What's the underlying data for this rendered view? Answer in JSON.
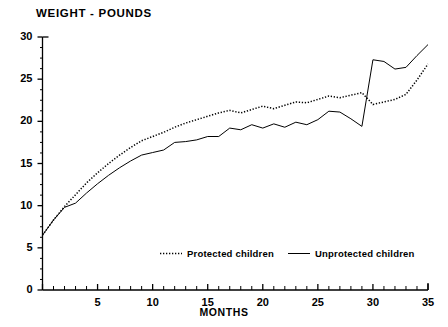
{
  "chart_data": {
    "type": "line",
    "title": "WEIGHT - POUNDS",
    "xlabel": "MONTHS",
    "ylabel": "WEIGHT - POUNDS",
    "xlim": [
      0,
      35
    ],
    "ylim": [
      0,
      30
    ],
    "grid": false,
    "legend_position": "inside-bottom-center",
    "y_ticks": [
      0,
      5,
      10,
      15,
      20,
      25,
      30
    ],
    "y_minor_tick_step": 1.25,
    "x_ticks": [
      0,
      5,
      10,
      15,
      20,
      25,
      30,
      35
    ],
    "x_tick_labels": [
      "",
      "5",
      "10",
      "15",
      "20",
      "25",
      "30",
      "35"
    ],
    "x_minor_tick_step": 1,
    "x": [
      0,
      1,
      2,
      3,
      4,
      5,
      6,
      7,
      8,
      9,
      10,
      11,
      12,
      13,
      14,
      15,
      16,
      17,
      18,
      19,
      20,
      21,
      22,
      23,
      24,
      25,
      26,
      27,
      28,
      29,
      30,
      31,
      32,
      33,
      34,
      35
    ],
    "series": [
      {
        "name": "Protected children",
        "style": "dotted",
        "color": "#000000",
        "values": [
          6.5,
          8.3,
          9.9,
          11.3,
          12.7,
          13.9,
          15.0,
          16.0,
          16.9,
          17.7,
          18.2,
          18.7,
          19.3,
          19.8,
          20.2,
          20.6,
          21.0,
          21.3,
          21.0,
          21.4,
          21.8,
          21.5,
          21.9,
          22.3,
          22.2,
          22.6,
          23.0,
          22.8,
          23.1,
          23.4,
          22.0,
          22.3,
          22.6,
          23.2,
          24.9,
          26.8
        ]
      },
      {
        "name": "Unprotected children",
        "style": "solid",
        "color": "#000000",
        "values": [
          6.5,
          8.3,
          9.8,
          10.3,
          11.5,
          12.6,
          13.6,
          14.5,
          15.3,
          16.0,
          16.3,
          16.6,
          17.5,
          17.6,
          17.8,
          18.2,
          18.2,
          19.2,
          19.0,
          19.6,
          19.2,
          19.7,
          19.3,
          19.9,
          19.6,
          20.2,
          21.2,
          21.1,
          20.3,
          19.4,
          27.3,
          27.1,
          26.2,
          26.4,
          27.8,
          29.1
        ]
      }
    ]
  },
  "legend": {
    "entries": [
      {
        "label": "Protected children",
        "marker": "dotted-line-swatch"
      },
      {
        "label": "Unprotected children",
        "marker": "solid-line-swatch"
      }
    ]
  }
}
